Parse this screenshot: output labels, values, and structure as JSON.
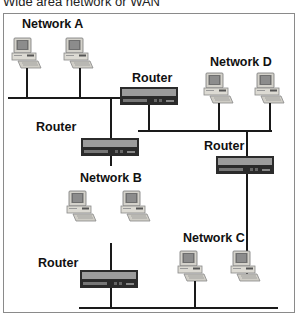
{
  "title": "Wide area network or WAN",
  "networks": {
    "a": {
      "label": "Network A"
    },
    "b": {
      "label": "Network B"
    },
    "c": {
      "label": "Network C"
    },
    "d": {
      "label": "Network D"
    }
  },
  "routers": [
    {
      "label": "Router"
    },
    {
      "label": "Router"
    },
    {
      "label": "Router"
    },
    {
      "label": "Router"
    }
  ],
  "colors": {
    "line": "#1a1a1a",
    "router_body": "#2b2b2b",
    "router_panel": "#9a9a9a",
    "computer_body": "#d8d6cf",
    "frame": "#8a8a8a"
  }
}
